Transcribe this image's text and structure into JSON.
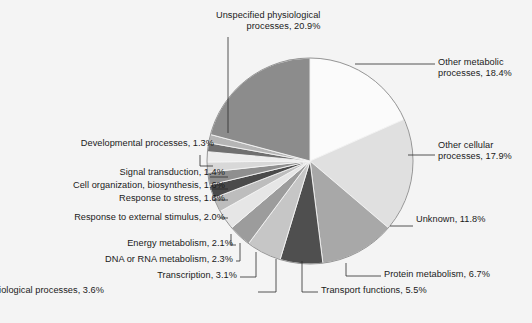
{
  "chart_data": {
    "type": "pie",
    "title": "",
    "units": "percent",
    "start_angle_deg": 0,
    "direction": "clockwise",
    "legend": "none",
    "labels_placement": "outside-with-leader-lines",
    "background_color": "#f4f4f4",
    "outline_color": "#7a7a7a",
    "categories": [
      "Other metabolic processes",
      "Other cellular processes",
      "Unknown",
      "Protein metabolism",
      "Transport functions",
      "Other biological processes",
      "Transcription",
      "DNA or RNA metabolism",
      "Energy metabolism",
      "Response to external stimulus",
      "Response to stress",
      "Cell organization, biosynthesis",
      "Signal transduction",
      "Developmental processes",
      "Unspecified physiological processes"
    ],
    "values": [
      18.4,
      17.9,
      11.8,
      6.7,
      5.5,
      3.6,
      3.1,
      2.3,
      2.1,
      2.0,
      1.6,
      1.6,
      1.4,
      1.3,
      20.9
    ],
    "colors": [
      "#fbfbfb",
      "#e0e0e0",
      "#a8a8a8",
      "#4f4f4f",
      "#c6c6c6",
      "#9c9c9c",
      "#e6e6e6",
      "#bdbdbd",
      "#4a4a4a",
      "#8f8f8f",
      "#d8d8d8",
      "#ededed",
      "#707070",
      "#b5b5b5",
      "#8c8c8c"
    ],
    "slices": [
      {
        "label": "Other metabolic processes",
        "value": 18.4,
        "display": "Other metabolic processes, 18.4%",
        "color": "#fbfbfb"
      },
      {
        "label": "Other cellular processes",
        "value": 17.9,
        "display": "Other cellular processes, 17.9%",
        "color": "#e0e0e0"
      },
      {
        "label": "Unknown",
        "value": 11.8,
        "display": "Unknown, 11.8%",
        "color": "#a8a8a8"
      },
      {
        "label": "Protein metabolism",
        "value": 6.7,
        "display": "Protein metabolism, 6.7%",
        "color": "#4f4f4f"
      },
      {
        "label": "Transport functions",
        "value": 5.5,
        "display": "Transport functions, 5.5%",
        "color": "#c6c6c6"
      },
      {
        "label": "Other biological processes",
        "value": 3.6,
        "display": "Other biological processes, 3.6%",
        "color": "#9c9c9c"
      },
      {
        "label": "Transcription",
        "value": 3.1,
        "display": "Transcription, 3.1%",
        "color": "#e6e6e6"
      },
      {
        "label": "DNA or RNA metabolism",
        "value": 2.3,
        "display": "DNA or RNA metabolism, 2.3%",
        "color": "#bdbdbd"
      },
      {
        "label": "Energy metabolism",
        "value": 2.1,
        "display": "Energy metabolism, 2.1%",
        "color": "#4a4a4a"
      },
      {
        "label": "Response to external stimulus",
        "value": 2.0,
        "display": "Response to external stimulus, 2.0%",
        "color": "#8f8f8f"
      },
      {
        "label": "Response to stress",
        "value": 1.6,
        "display": "Response to stress, 1.6%",
        "color": "#d8d8d8"
      },
      {
        "label": "Cell organization, biosynthesis",
        "value": 1.6,
        "display": "Cell organization, biosynthesis, 1.6%",
        "color": "#ededed"
      },
      {
        "label": "Signal transduction",
        "value": 1.4,
        "display": "Signal transduction, 1.4%",
        "color": "#707070"
      },
      {
        "label": "Developmental processes",
        "value": 1.3,
        "display": "Developmental processes, 1.3%",
        "color": "#b5b5b5"
      },
      {
        "label": "Unspecified physiological processes",
        "value": 20.9,
        "display": "Unspecified physiological processes, 20.9%",
        "color": "#8c8c8c"
      }
    ]
  },
  "labels": {
    "unspecified_line1": "Unspecified physiological",
    "unspecified_line2": "processes, 20.9%",
    "other_metabolic_line1": "Other metabolic",
    "other_metabolic_line2": "processes, 18.4%",
    "other_cellular_line1": "Other cellular",
    "other_cellular_line2": "processes, 17.9%",
    "unknown": "Unknown, 11.8%",
    "protein_metabolism": "Protein metabolism, 6.7%",
    "transport_functions": "Transport functions, 5.5%",
    "other_biological": "Other biological processes, 3.6%",
    "transcription": "Transcription, 3.1%",
    "dna_rna": "DNA or RNA metabolism, 2.3%",
    "energy_metabolism": "Energy metabolism, 2.1%",
    "external_stimulus": "Response to external stimulus, 2.0%",
    "response_stress": "Response to stress, 1.6%",
    "cell_organization": "Cell organization, biosynthesis, 1.6%",
    "signal_transduction": "Signal transduction, 1.4%",
    "developmental": "Developmental processes, 1.3%"
  }
}
